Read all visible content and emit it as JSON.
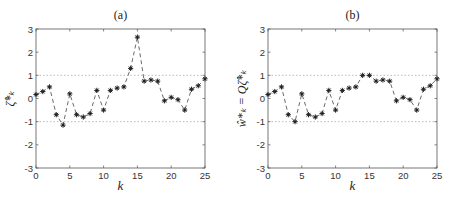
{
  "chart_data": [
    {
      "type": "line",
      "title": "(a)",
      "xlabel": "k",
      "ylabel": "ζ*_k",
      "ylabel_display": "ζ̂*ₖ",
      "xlim": [
        0,
        25
      ],
      "ylim": [
        -3,
        3
      ],
      "xticks": [
        0,
        5,
        10,
        15,
        20,
        25
      ],
      "yticks": [
        3,
        2,
        1,
        0,
        -1,
        -2,
        -3
      ],
      "reference_lines": [
        1,
        -1
      ],
      "line_style": "dashed",
      "marker": "asterisk",
      "x": [
        0,
        1,
        2,
        3,
        4,
        5,
        6,
        7,
        8,
        9,
        10,
        11,
        12,
        13,
        14,
        15,
        16,
        17,
        18,
        19,
        20,
        21,
        22,
        23,
        24,
        25
      ],
      "values": [
        0.17,
        0.3,
        0.5,
        -0.7,
        -1.15,
        0.2,
        -0.7,
        -0.8,
        -0.65,
        0.35,
        -0.5,
        0.35,
        0.45,
        0.5,
        1.3,
        2.65,
        0.75,
        0.8,
        0.75,
        -0.1,
        0.05,
        -0.05,
        -0.5,
        0.4,
        0.55,
        0.85
      ]
    },
    {
      "type": "line",
      "title": "(b)",
      "xlabel": "k",
      "ylabel": "ŵ*_k = Qζ̂*_k",
      "ylabel_display": "ŵ*ₖ = Qζ̂*ₖ",
      "xlim": [
        0,
        25
      ],
      "ylim": [
        -3,
        3
      ],
      "xticks": [
        0,
        5,
        10,
        15,
        20,
        25
      ],
      "yticks": [
        3,
        2,
        1,
        0,
        -1,
        -2,
        -3
      ],
      "reference_lines": [
        1,
        -1
      ],
      "line_style": "dashed",
      "marker": "asterisk",
      "x": [
        0,
        1,
        2,
        3,
        4,
        5,
        6,
        7,
        8,
        9,
        10,
        11,
        12,
        13,
        14,
        15,
        16,
        17,
        18,
        19,
        20,
        21,
        22,
        23,
        24,
        25
      ],
      "values": [
        0.17,
        0.3,
        0.5,
        -0.7,
        -1.0,
        0.2,
        -0.7,
        -0.8,
        -0.65,
        0.35,
        -0.5,
        0.35,
        0.45,
        0.5,
        1.0,
        1.0,
        0.75,
        0.8,
        0.75,
        -0.1,
        0.05,
        -0.05,
        -0.5,
        0.4,
        0.55,
        0.85
      ]
    }
  ],
  "style": {
    "axis_color": "#555555",
    "grid_ref_color": "#bbbbbb",
    "line_color": "#444444",
    "marker_color": "#222222"
  }
}
